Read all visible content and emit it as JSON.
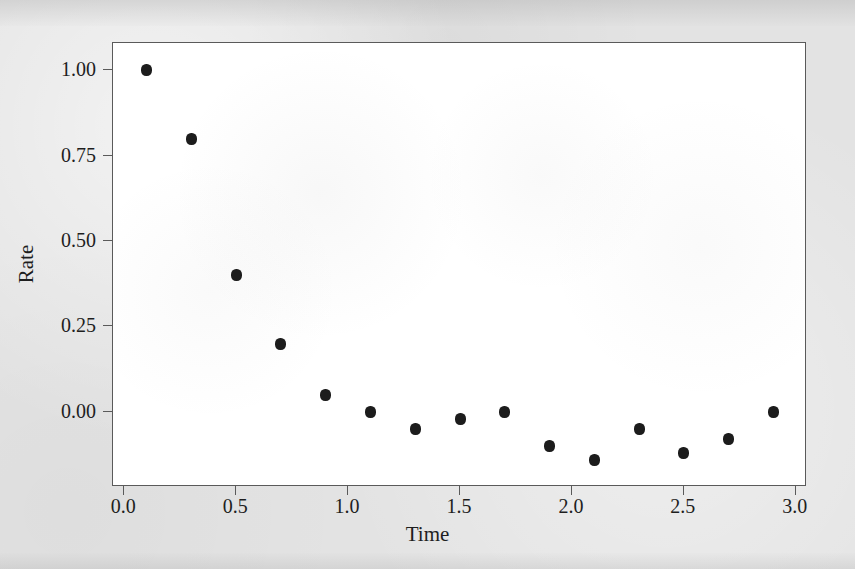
{
  "figure": {
    "background_color": "#e3e3e3",
    "panel_color": "#ffffff",
    "frame_color": "#5a5a5a",
    "marker_color": "#1c1c1c"
  },
  "chart_data": {
    "type": "scatter",
    "title": "",
    "xlabel": "Time",
    "ylabel": "Rate",
    "xlim": [
      -0.05,
      3.05
    ],
    "ylim": [
      -0.22,
      1.08
    ],
    "grid": false,
    "legend": null,
    "xticks": [
      0.0,
      0.5,
      1.0,
      1.5,
      2.0,
      2.5,
      3.0
    ],
    "xticklabels": [
      "0.0",
      "0.5",
      "1.0",
      "1.5",
      "2.0",
      "2.5",
      "3.0"
    ],
    "yticks": [
      0.0,
      0.25,
      0.5,
      0.75,
      1.0
    ],
    "yticklabels": [
      "0.00",
      "0.25",
      "0.50",
      "0.75",
      "1.00"
    ],
    "series": [
      {
        "name": "Rate",
        "marker": "circle",
        "color": "#1c1c1c",
        "x": [
          0.1,
          0.3,
          0.5,
          0.7,
          0.9,
          1.1,
          1.3,
          1.5,
          1.7,
          1.9,
          2.1,
          2.3,
          2.5,
          2.7,
          2.9
        ],
        "y": [
          1.0,
          0.8,
          0.4,
          0.2,
          0.05,
          0.0,
          -0.05,
          -0.02,
          0.0,
          -0.1,
          -0.14,
          -0.05,
          -0.12,
          -0.08,
          0.0
        ]
      }
    ]
  }
}
